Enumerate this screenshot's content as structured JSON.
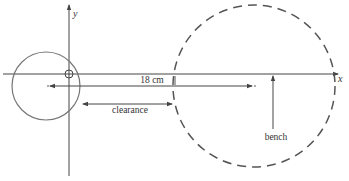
{
  "diagram": {
    "axes": {
      "x_label": "x",
      "y_label": "y"
    },
    "labels": {
      "distance": "18 cm",
      "clearance": "clearance",
      "bench": "bench"
    },
    "elements": {
      "origin_marker": "small circle at origin",
      "left_circle": "solid circle (rotating part)",
      "right_circle": "dashed circle (swept path)"
    },
    "colors": {
      "stroke": "#555555",
      "text": "#333333",
      "background": "#ffffff"
    }
  }
}
